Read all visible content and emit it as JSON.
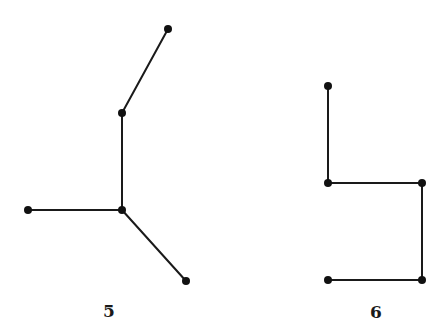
{
  "graphs": [
    {
      "id": "graph-5",
      "label": "5",
      "nodes": [
        "a",
        "b",
        "c",
        "d",
        "e"
      ],
      "edges": [
        [
          "a",
          "b"
        ],
        [
          "b",
          "c"
        ],
        [
          "c",
          "d"
        ],
        [
          "c",
          "e"
        ]
      ]
    },
    {
      "id": "graph-6",
      "label": "6",
      "nodes": [
        "a",
        "b",
        "c",
        "d",
        "e"
      ],
      "edges": [
        [
          "a",
          "b"
        ],
        [
          "b",
          "c"
        ],
        [
          "c",
          "d"
        ],
        [
          "d",
          "e"
        ]
      ]
    }
  ],
  "colors": {
    "edge": "#1a1a1a",
    "node": "#111111",
    "background": "#ffffff"
  }
}
